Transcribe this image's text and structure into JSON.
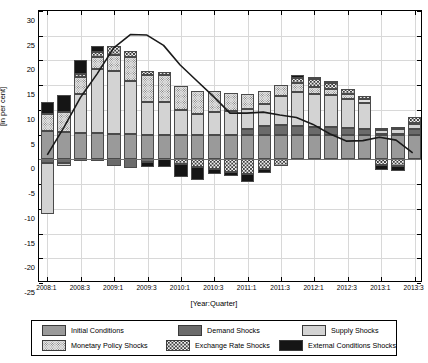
{
  "chart_data": {
    "type": "bar",
    "stacked": true,
    "title": "",
    "subtitle": "",
    "xlabel": "[Year:Quarter]",
    "ylabel": "[in per cent]",
    "ylim": [
      -25,
      30
    ],
    "ytick_step": 5,
    "yticks": [
      30,
      25,
      20,
      15,
      10,
      5,
      0,
      -5,
      -10,
      -15,
      -20,
      -25
    ],
    "ytick_labels": [
      "30",
      "25",
      "20",
      "15",
      "10",
      "5",
      "0",
      "-5",
      "-10",
      "-15",
      "-20",
      "-25"
    ],
    "grid": true,
    "legend_position": "bottom",
    "categories": [
      "2008:1",
      "2008:2",
      "2008:3",
      "2008:4",
      "2009:1",
      "2009:2",
      "2009:3",
      "2009:4",
      "2010:1",
      "2010:2",
      "2010:3",
      "2010:4",
      "2011:1",
      "2011:2",
      "2011:3",
      "2011:4",
      "2012:1",
      "2012:2",
      "2012:3",
      "2012:4",
      "2013:1",
      "2013:2",
      "2013:3"
    ],
    "xtick_labels": [
      "2008:1",
      "2008:3",
      "2009:1",
      "2009:3",
      "2010:1",
      "2010:3",
      "2011:1",
      "2011:3",
      "2012:1",
      "2012:3",
      "2013:1",
      "2013:3"
    ],
    "series": [
      {
        "name": "Initial Conditions",
        "color": "#9a9a9a",
        "pattern": "solid",
        "values": [
          5.8,
          5.6,
          5.3,
          5.3,
          5.2,
          5.1,
          5.0,
          5.0,
          5.0,
          5.0,
          5.0,
          5.0,
          5.0,
          5.0,
          5.0,
          5.0,
          5.0,
          5.0,
          5.0,
          5.0,
          4.9,
          4.9,
          4.9
        ]
      },
      {
        "name": "Demand Shocks",
        "color": "#6b6b6b",
        "pattern": "solid",
        "values": [
          -0.8,
          -0.7,
          -0.4,
          -0.3,
          -1.3,
          -1.7,
          -0.5,
          0.0,
          0.0,
          0.0,
          0.0,
          0.0,
          1.2,
          1.8,
          1.9,
          1.7,
          1.6,
          1.5,
          1.3,
          1.2,
          0.2,
          0.3,
          1.3
        ]
      },
      {
        "name": "Supply Shocks",
        "color": "#d3d3d3",
        "pattern": "solid",
        "values": [
          -10.3,
          -0.6,
          8.0,
          12.9,
          12.6,
          10.7,
          6.5,
          6.5,
          5.0,
          4.2,
          4.5,
          4.8,
          4.0,
          4.4,
          6.0,
          6.9,
          6.6,
          6.5,
          6.0,
          5.2,
          0.8,
          1.0,
          0.9
        ]
      },
      {
        "name": "Monetary Policy Shocks",
        "color": "#e6e6e6",
        "pattern": "fine-dots",
        "values": [
          3.3,
          3.9,
          3.4,
          2.4,
          3.3,
          4.8,
          5.5,
          5.5,
          4.9,
          4.6,
          4.3,
          3.7,
          3.0,
          2.6,
          2.2,
          1.8,
          1.5,
          1.3,
          1.0,
          0.8,
          0.5,
          0.4,
          0.3
        ]
      },
      {
        "name": "Exchange Rate Shocks",
        "color": "#f2f2f2",
        "pattern": "coarse-dots",
        "values": [
          0.0,
          0.0,
          0.5,
          1.1,
          1.8,
          1.4,
          0.8,
          0.6,
          -1.0,
          -1.5,
          -2.0,
          -2.5,
          -3.0,
          -2.0,
          -1.4,
          1.0,
          1.5,
          1.2,
          0.9,
          0.7,
          -1.2,
          -1.4,
          1.1
        ]
      },
      {
        "name": "External Conditions Shocks",
        "color": "#151515",
        "pattern": "solid",
        "values": [
          2.4,
          3.5,
          2.8,
          1.2,
          0.0,
          0.0,
          -1.0,
          -1.5,
          -2.5,
          -2.7,
          -1.0,
          -0.8,
          -1.5,
          -0.7,
          0.0,
          0.6,
          0.5,
          0.4,
          0.0,
          0.0,
          -0.9,
          -1.0,
          0.0
        ]
      }
    ],
    "line": {
      "name": "Total",
      "color": "#1a1a1a",
      "values": [
        0.7,
        6.3,
        12.4,
        17.2,
        22.5,
        25.2,
        25.1,
        23.0,
        19.0,
        15.8,
        12.6,
        9.2,
        9.2,
        9.4,
        8.8,
        8.3,
        6.9,
        5.0,
        3.5,
        3.6,
        4.3,
        3.7,
        1.1
      ]
    }
  },
  "legend": {
    "items": [
      {
        "label": "Initial Conditions",
        "swatch": "initial"
      },
      {
        "label": "Demand Shocks",
        "swatch": "demand"
      },
      {
        "label": "Supply Shocks",
        "swatch": "supply"
      },
      {
        "label": "Monetary Policy Shocks",
        "swatch": "monetary"
      },
      {
        "label": "Exchange Rate Shocks",
        "swatch": "exchange"
      },
      {
        "label": "External Conditions Shocks",
        "swatch": "external"
      }
    ]
  }
}
